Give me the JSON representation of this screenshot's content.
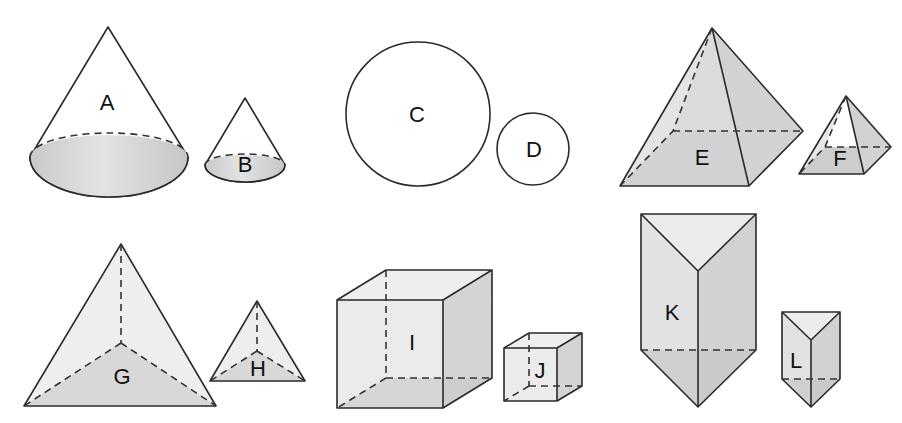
{
  "figure": {
    "colors": {
      "light_face": "#ececec",
      "mid_face": "#d9d9d9",
      "dark_face": "#c4c4c4",
      "edge": "#2a2a2a",
      "background": "#ffffff"
    },
    "shapes": [
      {
        "id": "A",
        "label": "A",
        "type": "cone",
        "size": "large"
      },
      {
        "id": "B",
        "label": "B",
        "type": "cone",
        "size": "small"
      },
      {
        "id": "C",
        "label": "C",
        "type": "sphere",
        "size": "large"
      },
      {
        "id": "D",
        "label": "D",
        "type": "sphere",
        "size": "small"
      },
      {
        "id": "E",
        "label": "E",
        "type": "square pyramid",
        "size": "large"
      },
      {
        "id": "F",
        "label": "F",
        "type": "square pyramid",
        "size": "small"
      },
      {
        "id": "G",
        "label": "G",
        "type": "triangular pyramid",
        "size": "large"
      },
      {
        "id": "H",
        "label": "H",
        "type": "triangular pyramid",
        "size": "small"
      },
      {
        "id": "I",
        "label": "I",
        "type": "cube",
        "size": "large"
      },
      {
        "id": "J",
        "label": "J",
        "type": "cube",
        "size": "small"
      },
      {
        "id": "K",
        "label": "K",
        "type": "triangular prism",
        "size": "large"
      },
      {
        "id": "L",
        "label": "L",
        "type": "triangular prism",
        "size": "small"
      }
    ]
  }
}
